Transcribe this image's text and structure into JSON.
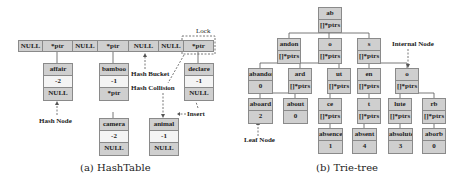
{
  "hashtable": {
    "buckets": [
      {
        "label": "NULL"
      },
      {
        "label": "*ptr"
      },
      {
        "label": "NULL"
      },
      {
        "label": "*ptr"
      },
      {
        "label": "NULL"
      },
      {
        "label": "NULL"
      },
      {
        "label": "*ptr"
      }
    ],
    "nodes": {
      "affair": {
        "key": "affair",
        "value": "-2",
        "next": "NULL"
      },
      "bamboo": {
        "key": "bamboo",
        "value": "-1",
        "next": "*ptr"
      },
      "camera": {
        "key": "camera",
        "value": "-2",
        "next": "NULL"
      },
      "declare": {
        "key": "declare",
        "value": "-1",
        "next": "NULL"
      },
      "animal": {
        "key": "animal",
        "value": "-1",
        "next": "NULL"
      }
    },
    "labels": {
      "lock": "Lock",
      "hash_bucket": "Hash Bucket",
      "hash_collision": "Hash Collision",
      "hash_node": "Hash Node",
      "insert": "Insert"
    },
    "caption": "(a) HashTable"
  },
  "trie": {
    "ptrs_label": "[]*ptrs",
    "nodes": {
      "ab": {
        "key": "ab",
        "val": "[]*ptrs"
      },
      "andon": {
        "key": "andon",
        "val": "[]*ptrs"
      },
      "o1": {
        "key": "o",
        "val": "[]*ptrs"
      },
      "s": {
        "key": "s",
        "val": "[]*ptrs"
      },
      "abandon": {
        "key": "abandon",
        "val": "0"
      },
      "ard": {
        "key": "ard",
        "val": "[]*ptrs"
      },
      "ut": {
        "key": "ut",
        "val": "[]*ptrs"
      },
      "en": {
        "key": "en",
        "val": "[]*ptrs"
      },
      "o2": {
        "key": "o",
        "val": "[]*ptrs"
      },
      "aboard": {
        "key": "aboard",
        "val": "2"
      },
      "about": {
        "key": "about",
        "val": "0"
      },
      "ce": {
        "key": "ce",
        "val": "[]*ptrs"
      },
      "t": {
        "key": "t",
        "val": "[]*ptrs"
      },
      "lute": {
        "key": "lute",
        "val": "[]*ptrs"
      },
      "rb": {
        "key": "rb",
        "val": "[]*ptrs"
      },
      "absence": {
        "key": "absence",
        "val": "1"
      },
      "absent": {
        "key": "absent",
        "val": "4"
      },
      "absolute": {
        "key": "absolute",
        "val": "3"
      },
      "aborb": {
        "key": "aborb",
        "val": "0"
      }
    },
    "labels": {
      "internal_node": "Internal Node",
      "leaf_node": "Leaf Node"
    },
    "caption": "(b) Trie-tree"
  }
}
